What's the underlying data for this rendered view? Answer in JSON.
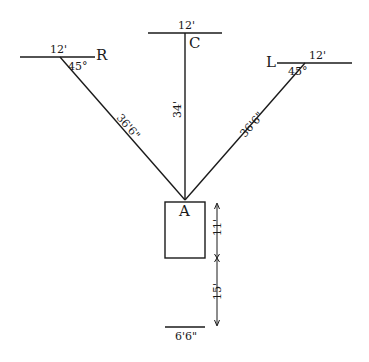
{
  "diagram": {
    "type": "rigging-layout",
    "colors": {
      "ink": "#1a1a1a",
      "background": "#ffffff"
    },
    "anchor": {
      "label": "A"
    },
    "anchors": {
      "right": {
        "label": "R",
        "width": "12'",
        "angle": "45°",
        "span": "36'6\""
      },
      "center": {
        "label": "C",
        "width": "12'",
        "span": "34'"
      },
      "left": {
        "label": "L",
        "width": "12'",
        "angle": "45°",
        "span": "36'6\""
      }
    },
    "box": {
      "height": "11'"
    },
    "offset": {
      "distance": "15'",
      "base_width": "6'6\""
    }
  }
}
